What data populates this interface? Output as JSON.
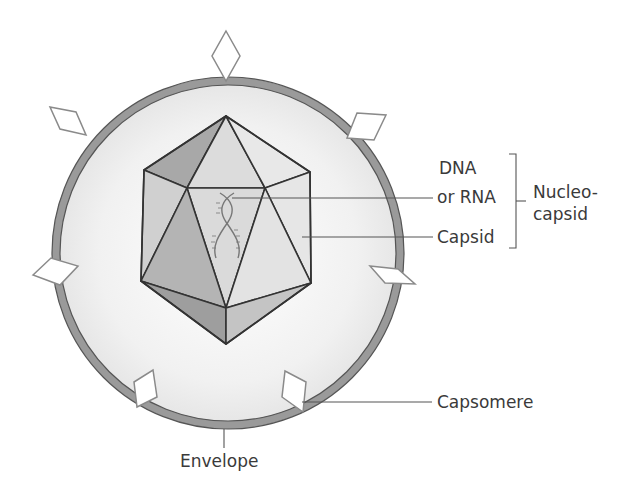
{
  "diagram": {
    "colors": {
      "envelope_ring": "#9a9a9a",
      "envelope_stroke": "#555555",
      "interior": "#efefef",
      "capsid_stroke": "#333333",
      "face_dark": "#9e9e9e",
      "face_mid": "#c4c4c4",
      "face_light": "#dedede",
      "face_lighter": "#ebebeb",
      "capsomere_fill": "#ffffff",
      "capsomere_stroke": "#8a8a8a",
      "leader_line": "#555555",
      "text": "#3a3a3a"
    },
    "labels": {
      "dna": "DNA",
      "or_rna": "or RNA",
      "capsid": "Capsid",
      "nucleocapsid_1": "Nucleo-",
      "nucleocapsid_2": "capsid",
      "capsomere": "Capsomere",
      "envelope": "Envelope"
    },
    "components": [
      "envelope",
      "capsomere",
      "capsid",
      "nucleic-acid",
      "nucleocapsid"
    ]
  }
}
